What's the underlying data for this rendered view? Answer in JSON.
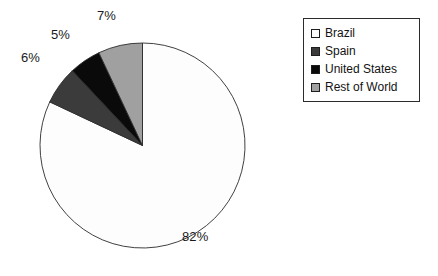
{
  "chart_data": {
    "type": "pie",
    "title": "",
    "categories": [
      "Brazil",
      "Spain",
      "United States",
      "Rest of World"
    ],
    "values": [
      82,
      6,
      5,
      7
    ],
    "value_labels": [
      "82%",
      "5%",
      "6%",
      "7%"
    ],
    "unit": "%",
    "legend_position": "right",
    "grid": false,
    "start_angle_deg": 0,
    "direction": "clockwise",
    "slices": [
      {
        "label": "Brazil",
        "value": 82,
        "display": "82%",
        "color": "#fdfdfd"
      },
      {
        "label": "Spain",
        "value": 6,
        "display": "6%",
        "color": "#3b3b3b"
      },
      {
        "label": "United States",
        "value": 5,
        "display": "5%",
        "color": "#0a0a0a"
      },
      {
        "label": "Rest of World",
        "value": 7,
        "display": "7%",
        "color": "#a0a0a0"
      }
    ]
  },
  "pie": {
    "labels": {
      "brazil": "82%",
      "spain": "6%",
      "united_states": "5%",
      "rest_of_world": "7%"
    }
  },
  "legend": {
    "items": [
      {
        "label": "Brazil",
        "swatch_color": "#fdfdfd"
      },
      {
        "label": "Spain",
        "swatch_color": "#3b3b3b"
      },
      {
        "label": "United States",
        "swatch_color": "#0a0a0a"
      },
      {
        "label": "Rest of World",
        "swatch_color": "#a0a0a0"
      }
    ]
  },
  "colors": {
    "outline": "#2b2b2b",
    "text": "#131313",
    "background": "#ffffff"
  }
}
